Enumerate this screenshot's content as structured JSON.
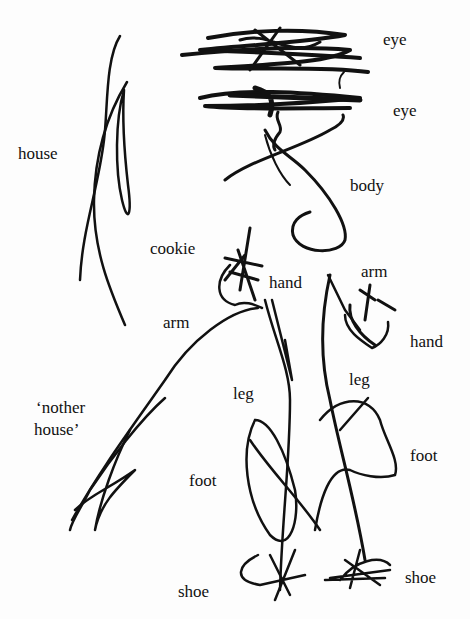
{
  "labels": {
    "eye_top": "eye",
    "eye_bottom": "eye",
    "house": "house",
    "body": "body",
    "cookie": "cookie",
    "hand_left": "hand",
    "arm_right": "arm",
    "arm_left": "arm",
    "hand_right": "hand",
    "nother_house_1": "‘nother",
    "nother_house_2": "house’",
    "leg_left": "leg",
    "leg_right": "leg",
    "foot_right": "foot",
    "foot_left": "foot",
    "shoe_left": "shoe",
    "shoe_right": "shoe"
  }
}
